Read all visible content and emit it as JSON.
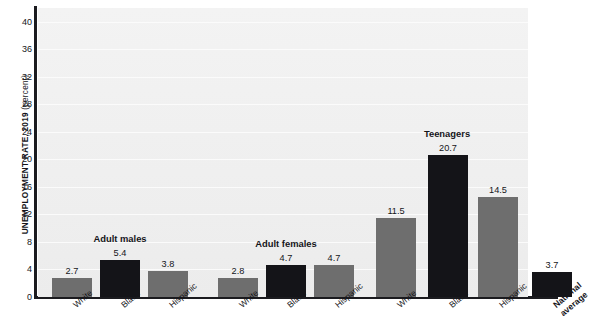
{
  "chart_data": {
    "type": "bar",
    "title": "",
    "xlabel": "",
    "ylabel": "UNEMPLOYMENT RATE, 2019",
    "ylabel_unit": "(percent)",
    "ylim": [
      0,
      42
    ],
    "yticks": [
      0,
      4,
      8,
      12,
      16,
      20,
      24,
      28,
      32,
      36,
      40
    ],
    "grid": true,
    "legend": "none",
    "categories": [
      "White",
      "Black",
      "Hispanic"
    ],
    "groups": [
      {
        "label": "Adult males",
        "bars": [
          {
            "category": "White",
            "value": 2.7,
            "value_label": "2.7",
            "color": "#6e6e6e"
          },
          {
            "category": "Black",
            "value": 5.4,
            "value_label": "5.4",
            "color": "#141418"
          },
          {
            "category": "Hispanic",
            "value": 3.8,
            "value_label": "3.8",
            "color": "#6e6e6e"
          }
        ]
      },
      {
        "label": "Adult females",
        "bars": [
          {
            "category": "White",
            "value": 2.8,
            "value_label": "2.8",
            "color": "#6e6e6e"
          },
          {
            "category": "Black",
            "value": 4.7,
            "value_label": "4.7",
            "color": "#141418"
          },
          {
            "category": "Hispanic",
            "value": 4.7,
            "value_label": "4.7",
            "color": "#6e6e6e"
          }
        ]
      },
      {
        "label": "Teenagers",
        "bars": [
          {
            "category": "White",
            "value": 11.5,
            "value_label": "11.5",
            "color": "#6e6e6e"
          },
          {
            "category": "Black",
            "value": 20.7,
            "value_label": "20.7",
            "color": "#141418"
          },
          {
            "category": "Hispanic",
            "value": 14.5,
            "value_label": "14.5",
            "color": "#6e6e6e"
          }
        ]
      },
      {
        "label": "",
        "bars": [
          {
            "category": "National average",
            "value": 3.7,
            "value_label": "3.7",
            "color": "#141418"
          }
        ]
      }
    ]
  },
  "axis": {
    "y_title_main": "UNEMPLOYMENT RATE, 2019",
    "y_title_unit": " (percent)",
    "tick_labels": [
      "40",
      "36",
      "32",
      "28",
      "24",
      "20",
      "16",
      "12",
      "8",
      "4",
      "0"
    ]
  },
  "xlabels": [
    {
      "text": "White",
      "bold": false
    },
    {
      "text": "Black",
      "bold": false
    },
    {
      "text": "Hispanic",
      "bold": false
    },
    {
      "text": "White",
      "bold": false
    },
    {
      "text": "Black",
      "bold": false
    },
    {
      "text": "Hispanic",
      "bold": false
    },
    {
      "text": "White",
      "bold": false
    },
    {
      "text": "Black",
      "bold": false
    },
    {
      "text": "Hispanic",
      "bold": false
    },
    {
      "text": "National average",
      "bold": true
    }
  ],
  "group_labels": [
    {
      "text": "Adult males"
    },
    {
      "text": "Adult females"
    },
    {
      "text": "Teenagers"
    }
  ],
  "colors": {
    "bar_gray": "#6e6e6e",
    "bar_black": "#141418",
    "axis": "#1b1b1f",
    "plot_background": "#f0f0f0",
    "gridline": "#fbfbfb",
    "text": "#15151a"
  }
}
